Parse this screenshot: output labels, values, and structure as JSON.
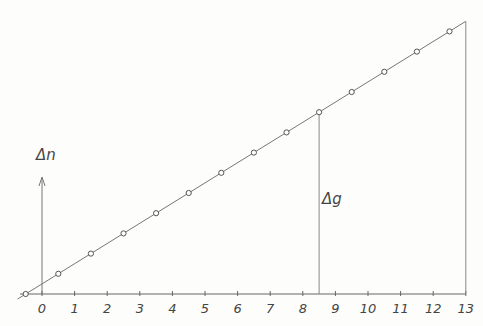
{
  "chart_data": {
    "type": "line",
    "title": "",
    "xlabel": "",
    "ylabel": "Δn",
    "annotation": "Δg",
    "annotation_x": 8.5,
    "x_ticks": [
      "0",
      "1",
      "2",
      "3",
      "4",
      "5",
      "6",
      "7",
      "8",
      "9",
      "10",
      "11",
      "12",
      "13"
    ],
    "xlim": [
      -0.7,
      13
    ],
    "points_x": [
      -0.5,
      0.5,
      1.5,
      2.5,
      3.5,
      4.5,
      5.5,
      6.5,
      7.5,
      8.5,
      9.5,
      10.5,
      11.5,
      12.5
    ],
    "points_y": [
      0,
      1,
      2,
      3,
      4,
      5,
      6,
      7,
      8,
      9,
      10,
      11,
      12,
      13
    ],
    "line_end_x": 13,
    "grid": false
  },
  "labels": {
    "y_axis": "Δn",
    "delta_g": "Δg"
  }
}
